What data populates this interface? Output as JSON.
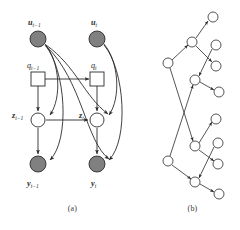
{
  "figure": {
    "type": "graphical-model-diagram",
    "width": 240,
    "height": 230,
    "background_color": "#ffffff"
  },
  "colors": {
    "stroke": "#2b2b2b",
    "shaded_node_fill": "#808080",
    "open_node_fill": "#ffffff",
    "square_node_fill": "#ffffff",
    "caption_text": "#3a3a3a"
  },
  "captions": {
    "panel_a": "(a)",
    "panel_b": "(b)"
  },
  "panel_a": {
    "name": "dynamic-bayesian-network",
    "nodes": [
      {
        "id": "u_prev",
        "label_base": "u",
        "label_sub": "t−1",
        "shape": "circle",
        "style": "shaded",
        "cx": 38,
        "cy": 39,
        "r": 8.0,
        "label_x": 30,
        "label_y": 24
      },
      {
        "id": "u_cur",
        "label_base": "u",
        "label_sub": "t",
        "shape": "circle",
        "style": "shaded",
        "cx": 97,
        "cy": 39,
        "r": 8.0,
        "label_x": 91,
        "label_y": 24
      },
      {
        "id": "q_prev",
        "label_base": "q",
        "label_sub": "t−1",
        "shape": "square",
        "style": "open",
        "cx": 38,
        "cy": 79,
        "r": 6.0,
        "label_x": 29,
        "label_y": 67
      },
      {
        "id": "q_cur",
        "label_base": "q",
        "label_sub": "t",
        "shape": "square",
        "style": "open",
        "cx": 97,
        "cy": 79,
        "r": 6.0,
        "label_x": 92,
        "label_y": 67
      },
      {
        "id": "z_prev",
        "label_base": "z",
        "label_sub": "t−1",
        "shape": "circle",
        "style": "open",
        "cx": 38,
        "cy": 120,
        "r": 7.0,
        "label_x": 14,
        "label_y": 117
      },
      {
        "id": "z_cur",
        "label_base": "z",
        "label_sub": "t",
        "shape": "circle",
        "style": "open",
        "cx": 97,
        "cy": 120,
        "r": 7.0,
        "label_x": 79,
        "label_y": 117
      },
      {
        "id": "y_prev",
        "label_base": "y",
        "label_sub": "t−1",
        "shape": "circle",
        "style": "shaded",
        "cx": 38,
        "cy": 164,
        "r": 8.0,
        "label_x": 29,
        "label_y": 184
      },
      {
        "id": "y_cur",
        "label_base": "y",
        "label_sub": "t",
        "shape": "circle",
        "style": "shaded",
        "cx": 97,
        "cy": 164,
        "r": 8.0,
        "label_x": 91,
        "label_y": 184
      }
    ],
    "edges": [
      {
        "from": "q_prev",
        "to": "q_cur",
        "kind": "straight"
      },
      {
        "from": "z_prev",
        "to": "z_cur",
        "kind": "straight"
      },
      {
        "from": "q_prev",
        "to": "z_prev",
        "kind": "straight"
      },
      {
        "from": "q_cur",
        "to": "z_cur",
        "kind": "straight"
      },
      {
        "from": "z_prev",
        "to": "y_prev",
        "kind": "straight"
      },
      {
        "from": "z_cur",
        "to": "y_cur",
        "kind": "straight"
      },
      {
        "from": "u_prev",
        "to": "z_prev",
        "kind": "curved"
      },
      {
        "from": "u_prev",
        "to": "y_prev",
        "kind": "curved"
      },
      {
        "from": "u_cur",
        "to": "z_cur",
        "kind": "curved"
      },
      {
        "from": "u_cur",
        "to": "y_cur",
        "kind": "curved"
      },
      {
        "from": "u_prev",
        "to": "z_cur",
        "kind": "curved-long"
      },
      {
        "from": "u_prev",
        "to": "y_cur",
        "kind": "curved-long"
      }
    ]
  },
  "panel_b": {
    "name": "tree-graph",
    "nodes": [
      {
        "id": "b1",
        "cx": 213,
        "cy": 17,
        "r": 5.0
      },
      {
        "id": "b2",
        "cx": 192,
        "cy": 42,
        "r": 5.0
      },
      {
        "id": "b3",
        "cx": 216,
        "cy": 45,
        "r": 5.0
      },
      {
        "id": "b4",
        "cx": 216,
        "cy": 66,
        "r": 5.0
      },
      {
        "id": "b5",
        "cx": 168,
        "cy": 63,
        "r": 5.0
      },
      {
        "id": "b6",
        "cx": 195,
        "cy": 80,
        "r": 5.0
      },
      {
        "id": "b7",
        "cx": 219,
        "cy": 92,
        "r": 5.0
      },
      {
        "id": "b8",
        "cx": 216,
        "cy": 119,
        "r": 5.0
      },
      {
        "id": "b9",
        "cx": 195,
        "cy": 146,
        "r": 5.0
      },
      {
        "id": "b10",
        "cx": 218,
        "cy": 143,
        "r": 5.0
      },
      {
        "id": "b11",
        "cx": 218,
        "cy": 164,
        "r": 5.0
      },
      {
        "id": "b12",
        "cx": 168,
        "cy": 161,
        "r": 5.0
      },
      {
        "id": "b13",
        "cx": 195,
        "cy": 182,
        "r": 5.0
      },
      {
        "id": "b14",
        "cx": 219,
        "cy": 194,
        "r": 5.0
      }
    ],
    "edges": [
      {
        "from": "b2",
        "to": "b1"
      },
      {
        "from": "b2",
        "to": "b4"
      },
      {
        "from": "b3",
        "to": "b6"
      },
      {
        "from": "b5",
        "to": "b2"
      },
      {
        "from": "b6",
        "to": "b7"
      },
      {
        "from": "b5",
        "to": "b9"
      },
      {
        "from": "b12",
        "to": "b6"
      },
      {
        "from": "b9",
        "to": "b8"
      },
      {
        "from": "b9",
        "to": "b11"
      },
      {
        "from": "b10",
        "to": "b13"
      },
      {
        "from": "b12",
        "to": "b9"
      },
      {
        "from": "b13",
        "to": "b14"
      }
    ]
  }
}
